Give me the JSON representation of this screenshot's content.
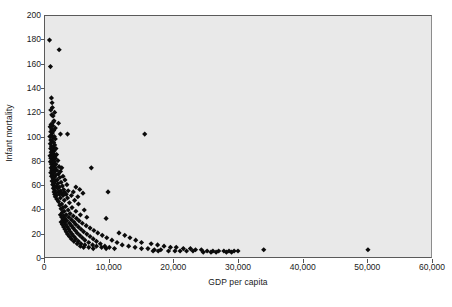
{
  "chart_data": {
    "type": "scatter",
    "title": "",
    "xlabel": "GDP per capita",
    "ylabel": "Infant mortality",
    "xlim": [
      0,
      60000
    ],
    "ylim": [
      0,
      200
    ],
    "xticks": [
      0,
      10000,
      20000,
      30000,
      40000,
      50000,
      60000
    ],
    "xticklabels": [
      "0",
      "10,000",
      "20,000",
      "30,000",
      "40,000",
      "50,000",
      "60,000"
    ],
    "yticks": [
      0,
      20,
      40,
      60,
      80,
      100,
      120,
      140,
      160,
      180,
      200
    ],
    "yticklabels": [
      "0",
      "20",
      "40",
      "60",
      "80",
      "100",
      "120",
      "140",
      "160",
      "180",
      "200"
    ],
    "grid": false,
    "legend": null,
    "marker": "diamond",
    "marker_color": "#0b0b0b",
    "plot_background": "#e9e9e9",
    "figure_background": "#ffffff",
    "points": [
      [
        700,
        180
      ],
      [
        2200,
        172
      ],
      [
        850,
        158
      ],
      [
        1000,
        132
      ],
      [
        1100,
        128
      ],
      [
        1150,
        124
      ],
      [
        900,
        122
      ],
      [
        1500,
        120
      ],
      [
        1050,
        118
      ],
      [
        1250,
        117
      ],
      [
        1400,
        113
      ],
      [
        1300,
        112
      ],
      [
        2100,
        111
      ],
      [
        950,
        110
      ],
      [
        1200,
        109
      ],
      [
        800,
        108
      ],
      [
        1600,
        107
      ],
      [
        1050,
        106
      ],
      [
        1350,
        105
      ],
      [
        900,
        104
      ],
      [
        1150,
        103
      ],
      [
        2400,
        102
      ],
      [
        3500,
        102
      ],
      [
        15500,
        102
      ],
      [
        1000,
        101
      ],
      [
        1450,
        100
      ],
      [
        750,
        100
      ],
      [
        1250,
        99
      ],
      [
        1600,
        98
      ],
      [
        900,
        97
      ],
      [
        1100,
        96
      ],
      [
        1350,
        95
      ],
      [
        820,
        94
      ],
      [
        1500,
        93
      ],
      [
        1000,
        92
      ],
      [
        1250,
        91
      ],
      [
        1700,
        90
      ],
      [
        880,
        90
      ],
      [
        1150,
        89
      ],
      [
        1400,
        88
      ],
      [
        950,
        87
      ],
      [
        1300,
        86
      ],
      [
        1800,
        85
      ],
      [
        1000,
        85
      ],
      [
        1550,
        84
      ],
      [
        780,
        84
      ],
      [
        1200,
        83
      ],
      [
        1600,
        82
      ],
      [
        900,
        82
      ],
      [
        1350,
        81
      ],
      [
        2000,
        80
      ],
      [
        1050,
        80
      ],
      [
        1450,
        79
      ],
      [
        850,
        79
      ],
      [
        1250,
        78
      ],
      [
        1700,
        77
      ],
      [
        1000,
        77
      ],
      [
        1400,
        76
      ],
      [
        2200,
        75
      ],
      [
        1150,
        75
      ],
      [
        1600,
        74
      ],
      [
        950,
        74
      ],
      [
        2600,
        74
      ],
      [
        7200,
        74
      ],
      [
        1300,
        73
      ],
      [
        1850,
        72
      ],
      [
        1050,
        72
      ],
      [
        1500,
        71
      ],
      [
        2400,
        71
      ],
      [
        900,
        70
      ],
      [
        1350,
        70
      ],
      [
        2100,
        69
      ],
      [
        1150,
        68
      ],
      [
        1700,
        68
      ],
      [
        2800,
        67
      ],
      [
        1000,
        67
      ],
      [
        1450,
        66
      ],
      [
        2300,
        66
      ],
      [
        1250,
        65
      ],
      [
        1900,
        64
      ],
      [
        3100,
        64
      ],
      [
        1100,
        63
      ],
      [
        1600,
        63
      ],
      [
        2500,
        62
      ],
      [
        1350,
        61
      ],
      [
        2000,
        61
      ],
      [
        3400,
        60
      ],
      [
        1200,
        60
      ],
      [
        1750,
        59
      ],
      [
        2700,
        59
      ],
      [
        1450,
        58
      ],
      [
        2200,
        58
      ],
      [
        4800,
        58
      ],
      [
        1300,
        57
      ],
      [
        1950,
        57
      ],
      [
        2900,
        56
      ],
      [
        5400,
        56
      ],
      [
        1550,
        55
      ],
      [
        2400,
        55
      ],
      [
        3600,
        55
      ],
      [
        1400,
        54
      ],
      [
        2100,
        54
      ],
      [
        3000,
        54
      ],
      [
        4400,
        54
      ],
      [
        1650,
        53
      ],
      [
        2600,
        53
      ],
      [
        5900,
        53
      ],
      [
        9800,
        54
      ],
      [
        1500,
        52
      ],
      [
        2250,
        52
      ],
      [
        3300,
        52
      ],
      [
        1750,
        51
      ],
      [
        2800,
        51
      ],
      [
        4100,
        51
      ],
      [
        5100,
        50
      ],
      [
        1600,
        50
      ],
      [
        2400,
        49
      ],
      [
        3500,
        49
      ],
      [
        1850,
        48
      ],
      [
        3000,
        47
      ],
      [
        4600,
        47
      ],
      [
        2100,
        46
      ],
      [
        3800,
        45
      ],
      [
        2600,
        44
      ],
      [
        5200,
        44
      ],
      [
        2300,
        43
      ],
      [
        3200,
        42
      ],
      [
        2800,
        41
      ],
      [
        4200,
        41
      ],
      [
        2500,
        40
      ],
      [
        3600,
        39
      ],
      [
        6100,
        39
      ],
      [
        3000,
        38
      ],
      [
        4800,
        38
      ],
      [
        2700,
        37
      ],
      [
        3900,
        36
      ],
      [
        2400,
        35
      ],
      [
        3300,
        35
      ],
      [
        5500,
        35
      ],
      [
        2900,
        34
      ],
      [
        4400,
        34
      ],
      [
        2600,
        33
      ],
      [
        3700,
        33
      ],
      [
        6500,
        33
      ],
      [
        3100,
        32
      ],
      [
        4900,
        32
      ],
      [
        2800,
        31
      ],
      [
        4100,
        31
      ],
      [
        9500,
        32
      ],
      [
        3400,
        30
      ],
      [
        5300,
        30
      ],
      [
        3000,
        29
      ],
      [
        4500,
        29
      ],
      [
        2500,
        29
      ],
      [
        3800,
        28
      ],
      [
        5800,
        28
      ],
      [
        3200,
        27
      ],
      [
        4800,
        27
      ],
      [
        2700,
        27
      ],
      [
        4100,
        26
      ],
      [
        6400,
        26
      ],
      [
        3500,
        25
      ],
      [
        5200,
        25
      ],
      [
        2900,
        25
      ],
      [
        4400,
        24
      ],
      [
        7000,
        24
      ],
      [
        3700,
        23
      ],
      [
        5600,
        23
      ],
      [
        3100,
        23
      ],
      [
        4700,
        22
      ],
      [
        7600,
        22
      ],
      [
        3900,
        21
      ],
      [
        6000,
        21
      ],
      [
        3300,
        21
      ],
      [
        5000,
        20
      ],
      [
        8200,
        20
      ],
      [
        11500,
        20
      ],
      [
        4200,
        19
      ],
      [
        6500,
        19
      ],
      [
        3500,
        19
      ],
      [
        5400,
        18
      ],
      [
        8900,
        18
      ],
      [
        12400,
        18
      ],
      [
        4500,
        17
      ],
      [
        7000,
        17
      ],
      [
        3800,
        17
      ],
      [
        5800,
        16
      ],
      [
        9600,
        16
      ],
      [
        13200,
        16
      ],
      [
        4800,
        15
      ],
      [
        7500,
        15
      ],
      [
        4100,
        15
      ],
      [
        6200,
        14
      ],
      [
        10400,
        14
      ],
      [
        14100,
        14
      ],
      [
        5200,
        13
      ],
      [
        8000,
        13
      ],
      [
        4500,
        13
      ],
      [
        6800,
        12
      ],
      [
        11200,
        12
      ],
      [
        15000,
        12
      ],
      [
        5600,
        11
      ],
      [
        8600,
        11
      ],
      [
        5000,
        11
      ],
      [
        7400,
        10
      ],
      [
        12000,
        10
      ],
      [
        16500,
        11
      ],
      [
        6200,
        10
      ],
      [
        9300,
        9
      ],
      [
        5500,
        9
      ],
      [
        8000,
        9
      ],
      [
        13000,
        9
      ],
      [
        17500,
        10
      ],
      [
        6800,
        8
      ],
      [
        10000,
        8
      ],
      [
        6000,
        8
      ],
      [
        8800,
        8
      ],
      [
        14000,
        8
      ],
      [
        18500,
        9
      ],
      [
        7500,
        7
      ],
      [
        10800,
        7
      ],
      [
        9500,
        7
      ],
      [
        15000,
        7
      ],
      [
        19500,
        8
      ],
      [
        16000,
        7
      ],
      [
        20400,
        8
      ],
      [
        17000,
        6
      ],
      [
        21500,
        7
      ],
      [
        18000,
        6
      ],
      [
        22600,
        7
      ],
      [
        16800,
        5
      ],
      [
        17600,
        5
      ],
      [
        23400,
        6
      ],
      [
        19200,
        5
      ],
      [
        24300,
        6
      ],
      [
        20200,
        5
      ],
      [
        25200,
        5
      ],
      [
        26100,
        5
      ],
      [
        21000,
        5
      ],
      [
        27000,
        5
      ],
      [
        27800,
        5
      ],
      [
        28600,
        5
      ],
      [
        29400,
        5
      ],
      [
        25800,
        4
      ],
      [
        26600,
        4
      ],
      [
        28200,
        4
      ],
      [
        29000,
        4
      ],
      [
        24600,
        4
      ],
      [
        23000,
        5
      ],
      [
        22000,
        5
      ],
      [
        30000,
        5
      ],
      [
        34000,
        6
      ],
      [
        50200,
        6
      ]
    ]
  },
  "axis": {
    "y_title": "Infant mortality",
    "x_title": "GDP per capita"
  }
}
